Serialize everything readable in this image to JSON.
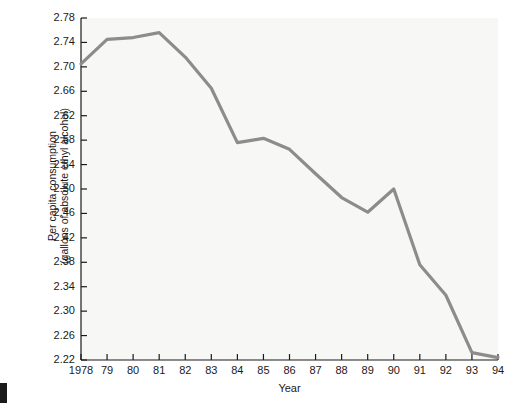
{
  "chart_data": {
    "type": "line",
    "title": "",
    "xlabel": "Year",
    "ylabel_line1": "Per capita consumption",
    "ylabel_line2": "(gallons of absolute ethyl alcohol)",
    "categories": [
      "1978",
      "79",
      "80",
      "81",
      "82",
      "83",
      "84",
      "85",
      "86",
      "87",
      "88",
      "89",
      "90",
      "91",
      "92",
      "93",
      "94"
    ],
    "x_values": [
      1978,
      1979,
      1980,
      1981,
      1982,
      1983,
      1984,
      1985,
      1986,
      1987,
      1988,
      1989,
      1990,
      1991,
      1992,
      1993,
      1994
    ],
    "values": [
      2.705,
      2.745,
      2.748,
      2.756,
      2.716,
      2.665,
      2.576,
      2.583,
      2.565,
      2.525,
      2.486,
      2.462,
      2.5,
      2.376,
      2.326,
      2.232,
      2.224
    ],
    "series": [
      {
        "name": "Per capita consumption",
        "values": [
          2.705,
          2.745,
          2.748,
          2.756,
          2.716,
          2.665,
          2.576,
          2.583,
          2.565,
          2.525,
          2.486,
          2.462,
          2.5,
          2.376,
          2.326,
          2.232,
          2.224
        ],
        "color": "#8c8c8c"
      }
    ],
    "ylim": [
      2.22,
      2.78
    ],
    "xlim": [
      1978,
      1994
    ],
    "ytick_labels": [
      "2.78",
      "2.74",
      "2.70",
      "2.66",
      "2.62",
      "2.58",
      "2.54",
      "2.50",
      "2.46",
      "2.42",
      "2.38",
      "2.34",
      "2.30",
      "2.26",
      "2.22"
    ],
    "ytick_values": [
      2.78,
      2.74,
      2.7,
      2.66,
      2.62,
      2.58,
      2.54,
      2.5,
      2.46,
      2.42,
      2.38,
      2.34,
      2.3,
      2.26,
      2.22
    ],
    "grid": false,
    "legend": "none",
    "line_color": "#8c8c8c",
    "axis_color": "#1a1a1a",
    "plot_background": "#f7f7f5"
  }
}
